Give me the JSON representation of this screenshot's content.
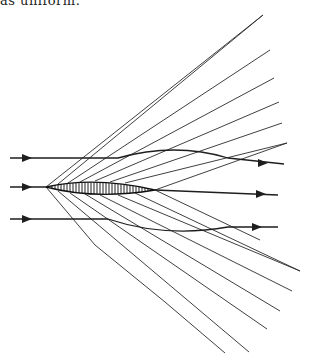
{
  "caption": {
    "text": "as uniform."
  },
  "diagram": {
    "colors": {
      "line": "#2a2a2a",
      "background": "#ffffff"
    },
    "airfoil": {
      "leading_edge": [
        46,
        187
      ],
      "trailing_edge": [
        155,
        190
      ],
      "max_half_thickness": 6
    },
    "streamlines": [
      {
        "name": "upper",
        "y_in": 158,
        "y_out": 164,
        "arrow_in_x": 28,
        "arrow_out_x": 264
      },
      {
        "name": "middle",
        "y_in": 187,
        "y_out": 195,
        "arrow_in_x": 28,
        "arrow_out_x": 262
      },
      {
        "name": "lower",
        "y_in": 219,
        "y_out": 227,
        "arrow_in_x": 28,
        "arrow_out_x": 258
      }
    ],
    "upper_wave_endpoints": [
      [
        263,
        15
      ],
      [
        270,
        50
      ],
      [
        274,
        78
      ],
      [
        279,
        102
      ],
      [
        282,
        123
      ],
      [
        287,
        143
      ]
    ],
    "lower_wave_endpoints": [
      [
        300,
        271
      ],
      [
        292,
        291
      ],
      [
        280,
        311
      ],
      [
        267,
        329
      ],
      [
        249,
        352
      ],
      [
        225,
        353
      ]
    ]
  }
}
